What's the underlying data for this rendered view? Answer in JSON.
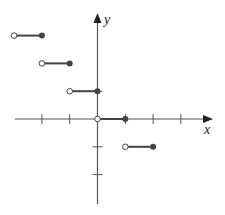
{
  "chart_data": {
    "type": "line",
    "title": "",
    "xlabel": "x",
    "ylabel": "y",
    "grid": false,
    "xlim": [
      -3,
      4
    ],
    "ylim": [
      -3,
      3.8
    ],
    "x_ticks": [
      -2,
      -1,
      1,
      2,
      3
    ],
    "y_ticks": [
      1,
      -1,
      -2
    ],
    "series": [
      {
        "name": "step-function",
        "segments": [
          {
            "x_start": -3,
            "x_end": -2,
            "y": 3,
            "start_open": true,
            "end_closed": true
          },
          {
            "x_start": -2,
            "x_end": -1,
            "y": 2,
            "start_open": true,
            "end_closed": true
          },
          {
            "x_start": -1,
            "x_end": 0,
            "y": 1,
            "start_open": true,
            "end_closed": true
          },
          {
            "x_start": 0,
            "x_end": 1,
            "y": 0,
            "start_open": true,
            "end_closed": true
          },
          {
            "x_start": 1,
            "x_end": 2,
            "y": -1,
            "start_open": true,
            "end_closed": true
          }
        ]
      }
    ]
  },
  "style": {
    "axis_color": "#555555",
    "segment_color": "#444444",
    "open_fill": "#ffffff"
  }
}
